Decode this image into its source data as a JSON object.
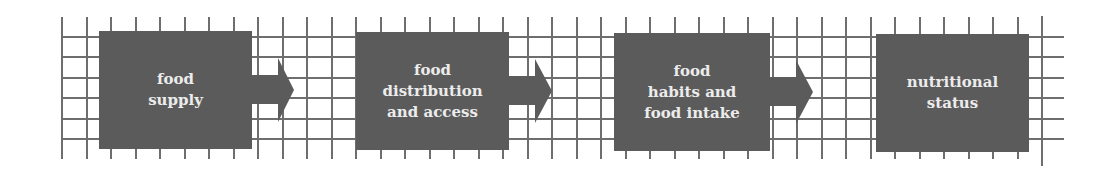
{
  "diagram": {
    "type": "flow",
    "colors": {
      "box": "#5b5b5b",
      "text": "#ececec",
      "grid": "#6e6e6e",
      "background": "#ffffff"
    },
    "steps": [
      {
        "label": "food\nsupply"
      },
      {
        "label": "food\ndistribution\nand access"
      },
      {
        "label": "food\nhabits and\nfood intake"
      },
      {
        "label": "nutritional\nstatus"
      }
    ],
    "connectors": [
      {
        "from": 0,
        "to": 1,
        "icon": "right-arrow-icon"
      },
      {
        "from": 1,
        "to": 2,
        "icon": "right-arrow-icon"
      },
      {
        "from": 2,
        "to": 3,
        "icon": "right-arrow-icon"
      }
    ]
  }
}
